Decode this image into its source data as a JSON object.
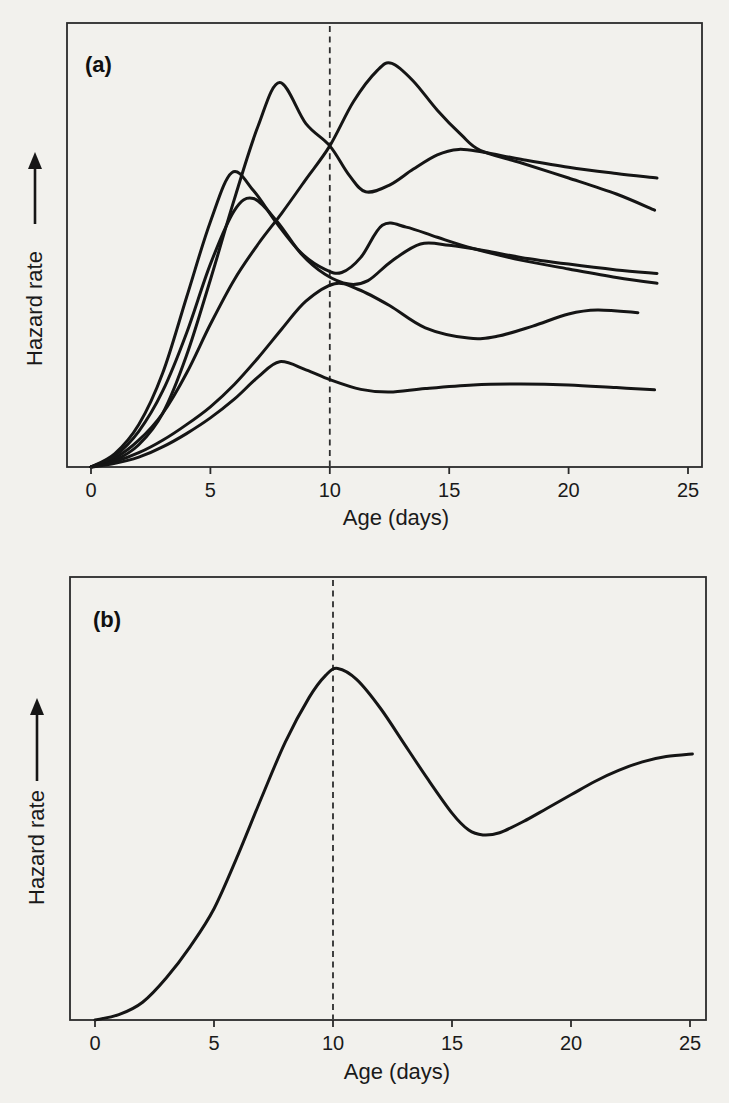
{
  "page": {
    "background_color": "#f2f1ed",
    "ink_color": "#151515"
  },
  "chart_data": [
    {
      "type": "line",
      "panel": "a",
      "title": "(a)",
      "xlabel": "Age (days)",
      "ylabel": "Hazard rate",
      "y_axis_arrow": "up",
      "x_ticks": [
        0,
        5,
        10,
        15,
        20,
        25
      ],
      "xlim": [
        -1.1,
        25.6
      ],
      "ylim": [
        0,
        1
      ],
      "y_axis_style": "relative scale, unlabeled (arrow = increasing)",
      "grid": "off",
      "legend": "none",
      "reference_line": {
        "style": "dashed-vertical",
        "x": 10
      },
      "series": [
        {
          "name": "curve-1-late-broad-peak",
          "points": [
            [
              0,
              0
            ],
            [
              1,
              0.02
            ],
            [
              2,
              0.06
            ],
            [
              3,
              0.12
            ],
            [
              4,
              0.21
            ],
            [
              5,
              0.32
            ],
            [
              6,
              0.42
            ],
            [
              7,
              0.5
            ],
            [
              8,
              0.57
            ],
            [
              9,
              0.645
            ],
            [
              10,
              0.72
            ],
            [
              11,
              0.82
            ],
            [
              12,
              0.89
            ],
            [
              12.6,
              0.905
            ],
            [
              13.5,
              0.865
            ],
            [
              14.5,
              0.8
            ],
            [
              15.5,
              0.745
            ],
            [
              16.3,
              0.71
            ],
            [
              18,
              0.682
            ],
            [
              20,
              0.648
            ],
            [
              22,
              0.612
            ],
            [
              23.6,
              0.576
            ]
          ]
        },
        {
          "name": "curve-2-tall-early-peak",
          "points": [
            [
              0,
              0
            ],
            [
              1,
              0.015
            ],
            [
              2,
              0.05
            ],
            [
              3,
              0.12
            ],
            [
              4,
              0.25
            ],
            [
              5,
              0.42
            ],
            [
              6,
              0.6
            ],
            [
              7,
              0.765
            ],
            [
              7.9,
              0.862
            ],
            [
              9,
              0.77
            ],
            [
              10,
              0.72
            ],
            [
              10.8,
              0.655
            ],
            [
              11.5,
              0.617
            ],
            [
              12.5,
              0.632
            ],
            [
              13.5,
              0.668
            ],
            [
              14.5,
              0.7
            ],
            [
              15.4,
              0.712
            ],
            [
              16.4,
              0.706
            ],
            [
              18,
              0.69
            ],
            [
              20,
              0.672
            ],
            [
              22,
              0.658
            ],
            [
              23.7,
              0.648
            ]
          ]
        },
        {
          "name": "curve-3-steep-early-peak",
          "points": [
            [
              0,
              0
            ],
            [
              1,
              0.03
            ],
            [
              2,
              0.095
            ],
            [
              3,
              0.21
            ],
            [
              4,
              0.38
            ],
            [
              5,
              0.55
            ],
            [
              5.9,
              0.66
            ],
            [
              6.8,
              0.62
            ],
            [
              7.8,
              0.545
            ],
            [
              8.8,
              0.48
            ],
            [
              9.8,
              0.443
            ],
            [
              10.5,
              0.436
            ],
            [
              11.3,
              0.47
            ],
            [
              12.2,
              0.542
            ],
            [
              13.2,
              0.538
            ],
            [
              14.5,
              0.515
            ],
            [
              16,
              0.49
            ],
            [
              18,
              0.464
            ],
            [
              20,
              0.444
            ],
            [
              22,
              0.425
            ],
            [
              23.7,
              0.412
            ]
          ]
        },
        {
          "name": "curve-4-mid-early-peak",
          "points": [
            [
              0,
              0
            ],
            [
              1,
              0.025
            ],
            [
              2,
              0.08
            ],
            [
              3,
              0.17
            ],
            [
              4,
              0.3
            ],
            [
              5,
              0.455
            ],
            [
              6,
              0.575
            ],
            [
              6.8,
              0.602
            ],
            [
              7.8,
              0.55
            ],
            [
              8.8,
              0.478
            ],
            [
              9.8,
              0.432
            ],
            [
              10.8,
              0.41
            ],
            [
              11.6,
              0.418
            ],
            [
              12.6,
              0.462
            ],
            [
              13.8,
              0.5
            ],
            [
              15,
              0.497
            ],
            [
              16.5,
              0.485
            ],
            [
              18,
              0.47
            ],
            [
              20,
              0.455
            ],
            [
              22,
              0.442
            ],
            [
              23.7,
              0.434
            ]
          ]
        },
        {
          "name": "curve-5-peak-at-reference",
          "points": [
            [
              0,
              0
            ],
            [
              1,
              0.012
            ],
            [
              2,
              0.032
            ],
            [
              3,
              0.06
            ],
            [
              4,
              0.095
            ],
            [
              5,
              0.135
            ],
            [
              6,
              0.185
            ],
            [
              7,
              0.245
            ],
            [
              8,
              0.31
            ],
            [
              9,
              0.372
            ],
            [
              10.2,
              0.411
            ],
            [
              11.2,
              0.398
            ],
            [
              12.5,
              0.362
            ],
            [
              14,
              0.312
            ],
            [
              15.8,
              0.289
            ],
            [
              17,
              0.293
            ],
            [
              18.5,
              0.316
            ],
            [
              20,
              0.343
            ],
            [
              21.2,
              0.352
            ],
            [
              22.9,
              0.346
            ]
          ]
        },
        {
          "name": "curve-6-low-flat",
          "points": [
            [
              0,
              0
            ],
            [
              1,
              0.008
            ],
            [
              2,
              0.022
            ],
            [
              3,
              0.045
            ],
            [
              4,
              0.075
            ],
            [
              5,
              0.11
            ],
            [
              6,
              0.152
            ],
            [
              7,
              0.202
            ],
            [
              7.9,
              0.236
            ],
            [
              9,
              0.218
            ],
            [
              10,
              0.196
            ],
            [
              11.3,
              0.174
            ],
            [
              12.5,
              0.168
            ],
            [
              14,
              0.176
            ],
            [
              16,
              0.184
            ],
            [
              18,
              0.186
            ],
            [
              20,
              0.184
            ],
            [
              22,
              0.178
            ],
            [
              23.6,
              0.173
            ]
          ]
        }
      ]
    },
    {
      "type": "line",
      "panel": "b",
      "title": "(b)",
      "xlabel": "Age (days)",
      "ylabel": "Hazard rate",
      "y_axis_arrow": "up",
      "x_ticks": [
        0,
        5,
        10,
        15,
        20,
        25
      ],
      "xlim": [
        -0.9,
        25.7
      ],
      "ylim": [
        0,
        1
      ],
      "y_axis_style": "relative scale, unlabeled (arrow = increasing)",
      "grid": "off",
      "legend": "none",
      "reference_line": {
        "style": "dashed-vertical",
        "x": 10
      },
      "series": [
        {
          "name": "curve-single-peak-trough-rise",
          "points": [
            [
              0,
              0
            ],
            [
              1,
              0.012
            ],
            [
              2,
              0.04
            ],
            [
              3,
              0.095
            ],
            [
              4,
              0.165
            ],
            [
              5,
              0.25
            ],
            [
              6,
              0.37
            ],
            [
              7,
              0.5
            ],
            [
              8,
              0.625
            ],
            [
              9,
              0.725
            ],
            [
              9.7,
              0.775
            ],
            [
              10.2,
              0.79
            ],
            [
              11,
              0.765
            ],
            [
              12,
              0.7
            ],
            [
              13,
              0.62
            ],
            [
              14,
              0.54
            ],
            [
              15,
              0.465
            ],
            [
              15.7,
              0.427
            ],
            [
              16.3,
              0.416
            ],
            [
              17,
              0.421
            ],
            [
              18,
              0.446
            ],
            [
              19,
              0.476
            ],
            [
              20,
              0.506
            ],
            [
              21,
              0.536
            ],
            [
              22,
              0.561
            ],
            [
              23,
              0.58
            ],
            [
              24,
              0.592
            ],
            [
              25.1,
              0.598
            ]
          ]
        }
      ]
    }
  ]
}
